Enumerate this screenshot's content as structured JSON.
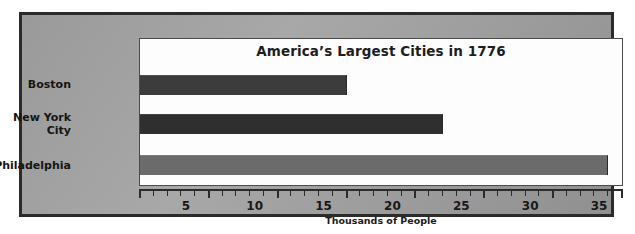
{
  "chart_data": {
    "type": "bar",
    "orientation": "horizontal",
    "title": "America’s Largest Cities in 1776",
    "categories": [
      "Boston",
      "New York City",
      "Philadelphia"
    ],
    "values": [
      15,
      22,
      34
    ],
    "series": [
      {
        "name": "Population",
        "values": [
          15,
          22,
          34
        ]
      }
    ],
    "xlabel": "Thousands of People",
    "ylabel": "",
    "xlim": [
      0,
      35
    ],
    "xticks": [
      0,
      5,
      10,
      15,
      20,
      25,
      30,
      35
    ],
    "xtick_labels": [
      "",
      "5",
      "10",
      "15",
      "20",
      "25",
      "30",
      "35"
    ],
    "minor_tick_step": 1,
    "grid": false,
    "legend": false,
    "bar_colors": [
      "#3c3c3c",
      "#2f2f2f",
      "#6b6b6b"
    ],
    "category_label_lines": [
      [
        "Boston"
      ],
      [
        "New York",
        "City"
      ],
      [
        "Philadelphia"
      ]
    ]
  },
  "style": {
    "panel_background": "#a0a0a0",
    "plot_background": "#fdfdfd",
    "frame_color": "#2b2b2b",
    "text_color": "#181818"
  }
}
